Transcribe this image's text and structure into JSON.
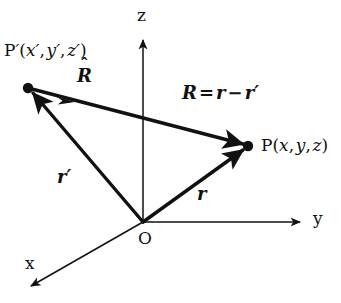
{
  "figure": {
    "name": "position-vector-diagram",
    "background_color": "#ffffff",
    "line_color": "#111111",
    "axes": {
      "z_label": "z",
      "y_label": "y",
      "x_label": "x",
      "origin_label": "O"
    },
    "points": {
      "source_point_label": "P",
      "source_point_prime": "′",
      "source_point_coords": "(x′, y′, z′)",
      "source_point_full": "P′(x′, y′, z′)",
      "field_point_label": "P",
      "field_point_coords": "(x, y, z)",
      "field_point_full": "P(x, y, z)"
    },
    "vectors": {
      "unit_vector_label": "R",
      "unit_vector_hat": "ˆ",
      "unit_vector_full": "R̂",
      "source_vector_label": "r",
      "source_vector_prime": "′",
      "source_vector_full": "r′",
      "field_vector_label": "r",
      "separation_equation_lhs": "R",
      "separation_equation_eq": "=",
      "separation_equation_rhs_first": "r",
      "separation_equation_minus": "−",
      "separation_equation_rhs_second": "r",
      "separation_equation_rhs_prime": "′",
      "separation_equation_full": "R = r − r′"
    },
    "geometry": {
      "origin": [
        143,
        222
      ],
      "source_point": [
        28,
        88
      ],
      "field_point": [
        248,
        146
      ],
      "z_axis_tip": [
        143,
        35
      ],
      "y_axis_tip": [
        305,
        222
      ],
      "x_axis_tip": [
        25,
        290
      ]
    }
  }
}
